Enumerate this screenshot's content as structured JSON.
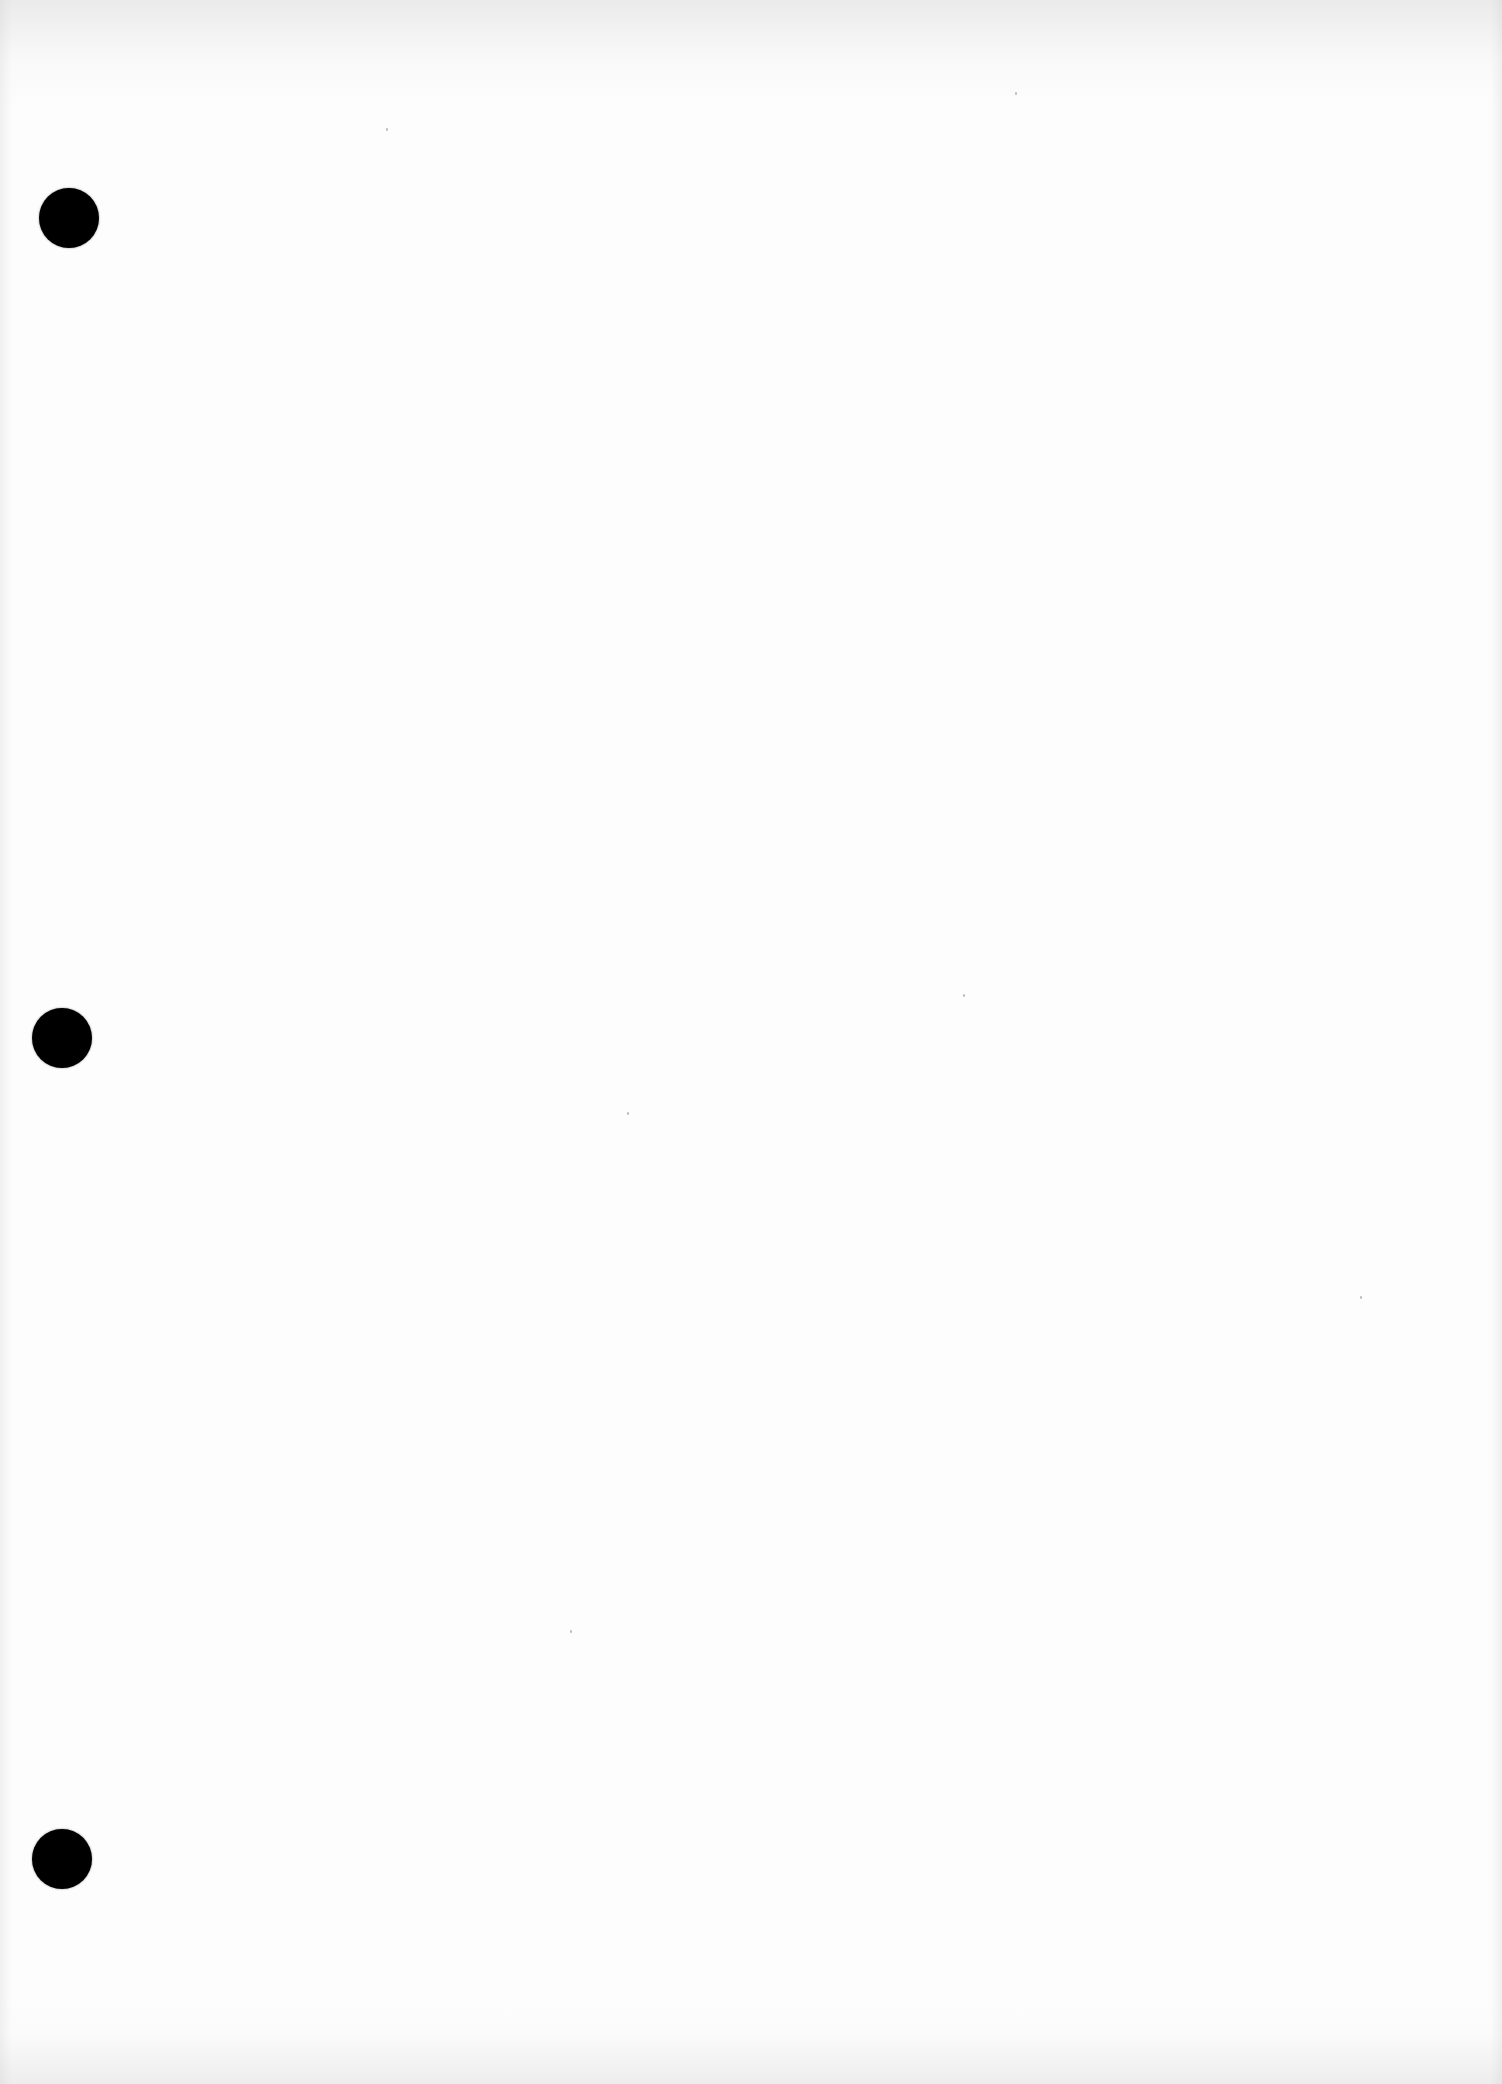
{
  "document": {
    "type": "blank scanned page",
    "text": "",
    "background_color": "#fdfdfd",
    "punch_holes": [
      {
        "cx": 69,
        "cy": 218,
        "diameter": 60,
        "color": "#000000"
      },
      {
        "cx": 62,
        "cy": 1038,
        "diameter": 60,
        "color": "#000000"
      },
      {
        "cx": 62,
        "cy": 1859,
        "diameter": 60,
        "color": "#000000"
      }
    ]
  }
}
